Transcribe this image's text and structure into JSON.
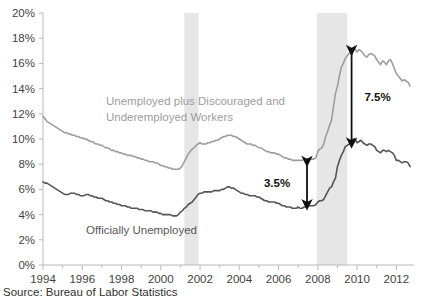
{
  "source_note": "Source: Bureau of Labor Statistics",
  "labels": {
    "series_u6": "Unemployed plus Discouraged and\nUnderemployed Workers",
    "series_u6_line1": "Unemployed plus Discouraged and",
    "series_u6_line2": "Underemployed Workers",
    "series_u3": "Officially Unemployed",
    "gap_2007": "3.5%",
    "gap_2009": "7.5%"
  },
  "colors": {
    "series_u6": "#9d9d9d",
    "series_u3": "#555555",
    "recession_band": "#e6e6e6",
    "axis": "#b9b9b9",
    "annotation": "#111111",
    "text": "#3f3f3f"
  },
  "chart_data": {
    "type": "line",
    "title": "",
    "subtitle": "",
    "xlabel": "",
    "ylabel": "",
    "xlim": [
      1994.0,
      2012.9
    ],
    "ylim": [
      0,
      20
    ],
    "grid": false,
    "legend": "inline-annotations",
    "ytick_labels": [
      "0%",
      "2%",
      "4%",
      "6%",
      "8%",
      "10%",
      "12%",
      "14%",
      "16%",
      "18%",
      "20%"
    ],
    "ytick_values": [
      0,
      2,
      4,
      6,
      8,
      10,
      12,
      14,
      16,
      18,
      20
    ],
    "xtick_labels": [
      "1994",
      "1996",
      "1998",
      "2000",
      "2002",
      "2004",
      "2006",
      "2008",
      "2010",
      "2012"
    ],
    "xtick_values": [
      1994,
      1996,
      1998,
      2000,
      2002,
      2004,
      2006,
      2008,
      2010,
      2012
    ],
    "x_minor_step": 1,
    "shaded_regions": [
      {
        "name": "recession-2001",
        "x_start": 2001.2,
        "x_end": 2001.92,
        "color": "#e6e6e6"
      },
      {
        "name": "recession-2008",
        "x_start": 2007.95,
        "x_end": 2009.5,
        "color": "#e6e6e6"
      }
    ],
    "annotations": [
      {
        "name": "gap-arrow-2007",
        "label": "3.5%",
        "x": 2007.45,
        "y_top": 8.3,
        "y_bottom": 4.7,
        "value": 3.5
      },
      {
        "name": "gap-arrow-2009",
        "label": "7.5%",
        "x": 2009.72,
        "y_top": 17.1,
        "y_bottom": 9.6,
        "value": 7.5
      }
    ],
    "series": [
      {
        "name": "Unemployed plus Discouraged and Underemployed Workers",
        "key": "u6",
        "color": "#9d9d9d",
        "x": [
          1994.0,
          1994.1,
          1994.2,
          1994.3,
          1994.4,
          1994.5,
          1994.6,
          1994.7,
          1994.8,
          1994.9,
          1995.0,
          1995.1,
          1995.2,
          1995.3,
          1995.4,
          1995.5,
          1995.6,
          1995.7,
          1995.8,
          1995.9,
          1996.0,
          1996.1,
          1996.2,
          1996.3,
          1996.4,
          1996.5,
          1996.6,
          1996.7,
          1996.8,
          1996.9,
          1997.0,
          1997.1,
          1997.2,
          1997.3,
          1997.4,
          1997.5,
          1997.6,
          1997.7,
          1997.8,
          1997.9,
          1998.0,
          1998.1,
          1998.2,
          1998.3,
          1998.4,
          1998.5,
          1998.6,
          1998.7,
          1998.8,
          1998.9,
          1999.0,
          1999.1,
          1999.2,
          1999.3,
          1999.4,
          1999.5,
          1999.6,
          1999.7,
          1999.8,
          1999.9,
          2000.0,
          2000.1,
          2000.2,
          2000.3,
          2000.4,
          2000.5,
          2000.6,
          2000.7,
          2000.8,
          2000.9,
          2001.0,
          2001.1,
          2001.2,
          2001.3,
          2001.4,
          2001.5,
          2001.6,
          2001.7,
          2001.8,
          2001.9,
          2002.0,
          2002.1,
          2002.2,
          2002.3,
          2002.4,
          2002.5,
          2002.6,
          2002.7,
          2002.8,
          2002.9,
          2003.0,
          2003.1,
          2003.2,
          2003.3,
          2003.4,
          2003.5,
          2003.6,
          2003.7,
          2003.8,
          2003.9,
          2004.0,
          2004.1,
          2004.2,
          2004.3,
          2004.4,
          2004.5,
          2004.6,
          2004.7,
          2004.8,
          2004.9,
          2005.0,
          2005.1,
          2005.2,
          2005.3,
          2005.4,
          2005.5,
          2005.6,
          2005.7,
          2005.8,
          2005.9,
          2006.0,
          2006.1,
          2006.2,
          2006.3,
          2006.4,
          2006.5,
          2006.6,
          2006.7,
          2006.8,
          2006.9,
          2007.0,
          2007.1,
          2007.2,
          2007.3,
          2007.4,
          2007.5,
          2007.6,
          2007.7,
          2007.8,
          2007.9,
          2008.0,
          2008.1,
          2008.2,
          2008.3,
          2008.4,
          2008.5,
          2008.6,
          2008.7,
          2008.8,
          2008.9,
          2009.0,
          2009.1,
          2009.2,
          2009.3,
          2009.4,
          2009.5,
          2009.6,
          2009.7,
          2009.8,
          2009.9,
          2010.0,
          2010.1,
          2010.2,
          2010.3,
          2010.4,
          2010.5,
          2010.6,
          2010.7,
          2010.8,
          2010.9,
          2011.0,
          2011.1,
          2011.2,
          2011.3,
          2011.4,
          2011.5,
          2011.6,
          2011.7,
          2011.8,
          2011.9,
          2012.0,
          2012.1,
          2012.2,
          2012.3,
          2012.4,
          2012.5,
          2012.6,
          2012.7
        ],
        "y": [
          11.8,
          11.6,
          11.4,
          11.3,
          11.2,
          11.1,
          11.0,
          10.9,
          10.8,
          10.7,
          10.6,
          10.5,
          10.5,
          10.4,
          10.4,
          10.3,
          10.3,
          10.2,
          10.2,
          10.1,
          10.1,
          10.0,
          10.0,
          9.9,
          9.8,
          9.8,
          9.7,
          9.6,
          9.6,
          9.5,
          9.5,
          9.4,
          9.3,
          9.3,
          9.2,
          9.1,
          9.1,
          9.0,
          9.0,
          8.9,
          8.9,
          8.8,
          8.8,
          8.7,
          8.7,
          8.7,
          8.6,
          8.6,
          8.5,
          8.5,
          8.4,
          8.4,
          8.3,
          8.3,
          8.2,
          8.2,
          8.2,
          8.1,
          8.1,
          8.0,
          7.9,
          7.9,
          7.8,
          7.8,
          7.7,
          7.7,
          7.6,
          7.6,
          7.6,
          7.6,
          7.7,
          7.9,
          8.2,
          8.5,
          8.8,
          9.0,
          9.2,
          9.3,
          9.5,
          9.6,
          9.7,
          9.6,
          9.6,
          9.6,
          9.7,
          9.7,
          9.8,
          9.8,
          9.9,
          9.9,
          10.0,
          10.1,
          10.2,
          10.2,
          10.3,
          10.3,
          10.3,
          10.2,
          10.2,
          10.1,
          10.0,
          9.9,
          9.8,
          9.7,
          9.6,
          9.6,
          9.6,
          9.5,
          9.5,
          9.4,
          9.3,
          9.3,
          9.2,
          9.1,
          9.0,
          9.0,
          8.9,
          8.9,
          8.9,
          8.8,
          8.8,
          8.7,
          8.6,
          8.5,
          8.5,
          8.4,
          8.4,
          8.3,
          8.3,
          8.3,
          8.3,
          8.3,
          8.3,
          8.4,
          8.4,
          8.4,
          8.4,
          8.4,
          8.4,
          8.5,
          9.0,
          9.2,
          9.3,
          9.6,
          10.2,
          10.6,
          11.1,
          11.5,
          12.6,
          13.6,
          14.2,
          15.0,
          15.7,
          16.0,
          16.4,
          16.6,
          16.8,
          17.0,
          17.2,
          17.1,
          16.9,
          17.1,
          17.0,
          16.8,
          16.6,
          16.5,
          16.7,
          16.8,
          16.7,
          16.6,
          16.3,
          16.1,
          15.9,
          16.2,
          16.1,
          15.9,
          16.2,
          16.3,
          16.0,
          15.6,
          15.2,
          15.0,
          14.8,
          14.6,
          14.7,
          14.6,
          14.5,
          14.2
        ]
      },
      {
        "name": "Officially Unemployed",
        "key": "u3",
        "color": "#555555",
        "x": [
          1994.0,
          1994.1,
          1994.2,
          1994.3,
          1994.4,
          1994.5,
          1994.6,
          1994.7,
          1994.8,
          1994.9,
          1995.0,
          1995.1,
          1995.2,
          1995.3,
          1995.4,
          1995.5,
          1995.6,
          1995.7,
          1995.8,
          1995.9,
          1996.0,
          1996.1,
          1996.2,
          1996.3,
          1996.4,
          1996.5,
          1996.6,
          1996.7,
          1996.8,
          1996.9,
          1997.0,
          1997.1,
          1997.2,
          1997.3,
          1997.4,
          1997.5,
          1997.6,
          1997.7,
          1997.8,
          1997.9,
          1998.0,
          1998.1,
          1998.2,
          1998.3,
          1998.4,
          1998.5,
          1998.6,
          1998.7,
          1998.8,
          1998.9,
          1999.0,
          1999.1,
          1999.2,
          1999.3,
          1999.4,
          1999.5,
          1999.6,
          1999.7,
          1999.8,
          1999.9,
          2000.0,
          2000.1,
          2000.2,
          2000.3,
          2000.4,
          2000.5,
          2000.6,
          2000.7,
          2000.8,
          2000.9,
          2001.0,
          2001.1,
          2001.2,
          2001.3,
          2001.4,
          2001.5,
          2001.6,
          2001.7,
          2001.8,
          2001.9,
          2002.0,
          2002.1,
          2002.2,
          2002.3,
          2002.4,
          2002.5,
          2002.6,
          2002.7,
          2002.8,
          2002.9,
          2003.0,
          2003.1,
          2003.2,
          2003.3,
          2003.4,
          2003.5,
          2003.6,
          2003.7,
          2003.8,
          2003.9,
          2004.0,
          2004.1,
          2004.2,
          2004.3,
          2004.4,
          2004.5,
          2004.6,
          2004.7,
          2004.8,
          2004.9,
          2005.0,
          2005.1,
          2005.2,
          2005.3,
          2005.4,
          2005.5,
          2005.6,
          2005.7,
          2005.8,
          2005.9,
          2006.0,
          2006.1,
          2006.2,
          2006.3,
          2006.4,
          2006.5,
          2006.6,
          2006.7,
          2006.8,
          2006.9,
          2007.0,
          2007.1,
          2007.2,
          2007.3,
          2007.4,
          2007.5,
          2007.6,
          2007.7,
          2007.8,
          2007.9,
          2008.0,
          2008.1,
          2008.2,
          2008.3,
          2008.4,
          2008.5,
          2008.6,
          2008.7,
          2008.8,
          2008.9,
          2009.0,
          2009.1,
          2009.2,
          2009.3,
          2009.4,
          2009.5,
          2009.6,
          2009.7,
          2009.8,
          2009.9,
          2010.0,
          2010.1,
          2010.2,
          2010.3,
          2010.4,
          2010.5,
          2010.6,
          2010.7,
          2010.8,
          2010.9,
          2011.0,
          2011.1,
          2011.2,
          2011.3,
          2011.4,
          2011.5,
          2011.6,
          2011.7,
          2011.8,
          2011.9,
          2012.0,
          2012.1,
          2012.2,
          2012.3,
          2012.4,
          2012.5,
          2012.6,
          2012.7
        ],
        "y": [
          6.6,
          6.5,
          6.5,
          6.4,
          6.3,
          6.2,
          6.1,
          6.0,
          5.9,
          5.8,
          5.7,
          5.6,
          5.6,
          5.6,
          5.7,
          5.7,
          5.7,
          5.6,
          5.6,
          5.5,
          5.5,
          5.5,
          5.6,
          5.6,
          5.5,
          5.5,
          5.4,
          5.4,
          5.3,
          5.3,
          5.3,
          5.2,
          5.1,
          5.1,
          5.0,
          5.0,
          4.9,
          4.9,
          4.8,
          4.8,
          4.7,
          4.7,
          4.7,
          4.6,
          4.6,
          4.5,
          4.5,
          4.5,
          4.5,
          4.4,
          4.4,
          4.4,
          4.3,
          4.3,
          4.3,
          4.3,
          4.2,
          4.2,
          4.2,
          4.1,
          4.1,
          4.0,
          4.0,
          4.0,
          4.0,
          4.0,
          3.9,
          3.9,
          3.9,
          4.0,
          4.2,
          4.3,
          4.5,
          4.6,
          4.8,
          4.9,
          5.0,
          5.2,
          5.4,
          5.6,
          5.7,
          5.7,
          5.8,
          5.8,
          5.8,
          5.8,
          5.8,
          5.9,
          5.9,
          5.9,
          5.9,
          6.0,
          6.0,
          6.1,
          6.2,
          6.2,
          6.1,
          6.1,
          6.0,
          5.9,
          5.8,
          5.7,
          5.7,
          5.6,
          5.6,
          5.5,
          5.5,
          5.5,
          5.5,
          5.4,
          5.4,
          5.3,
          5.2,
          5.1,
          5.1,
          5.0,
          5.0,
          5.0,
          5.0,
          4.9,
          4.9,
          4.8,
          4.7,
          4.7,
          4.6,
          4.6,
          4.6,
          4.5,
          4.5,
          4.5,
          4.6,
          4.5,
          4.5,
          4.6,
          4.6,
          4.7,
          4.7,
          4.7,
          4.7,
          4.8,
          5.0,
          5.1,
          5.1,
          5.2,
          5.5,
          5.8,
          6.1,
          6.2,
          6.6,
          6.9,
          7.8,
          8.3,
          8.7,
          9.0,
          9.4,
          9.5,
          9.6,
          9.8,
          10.0,
          10.0,
          9.7,
          9.8,
          9.9,
          9.7,
          9.6,
          9.5,
          9.6,
          9.6,
          9.5,
          9.4,
          9.1,
          9.0,
          8.9,
          9.1,
          9.1,
          9.0,
          9.1,
          9.0,
          8.9,
          8.7,
          8.3,
          8.3,
          8.2,
          8.1,
          8.2,
          8.2,
          8.1,
          7.8
        ]
      }
    ]
  }
}
